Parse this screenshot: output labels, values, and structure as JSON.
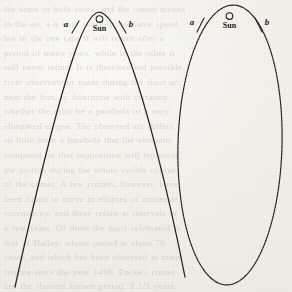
{
  "page": {
    "background_color": "#f2efe9",
    "ink_color": "#262220",
    "width": 292,
    "height": 292
  },
  "figures": [
    {
      "id": "left-figure",
      "name": "parabolic-orbit",
      "orbit_type": "parabola",
      "sun_symbol": "☉",
      "sun_label": "Sun",
      "point_a_label": "a",
      "point_b_label": "b",
      "description": "Open parabolic path with the Sun at the focus near the vertex"
    },
    {
      "id": "right-figure",
      "name": "elliptical-orbit",
      "orbit_type": "ellipse",
      "sun_symbol": "☉",
      "sun_label": "Sun",
      "point_a_label": "a",
      "point_b_label": "b",
      "description": "Closed elongated elliptical path with the Sun at the focus near the perihelion"
    }
  ],
  "labels": {
    "left_a": "a",
    "left_b": "b",
    "left_sun": "Sun",
    "left_sun_symbol": "☉",
    "right_a": "a",
    "right_b": "b",
    "right_sun": "Sun",
    "right_sun_symbol": "☉"
  },
  "showthrough_text": "the same in both cases, and the comet moves\nin the arc a b with sensibly the same speed;\nbut in the one case it will return after a\nperiod of many years, while in the other it\nwill never return. It is therefore not possible,\nfrom observations made during the short arc\nnear the Sun, to determine with certainty\nwhether the orbit be a parabola or a very\nelongated ellipse. The observed arc differs\nso little from a parabola that the elements\ncomputed on that supposition will represent\nthe motion during the whole visible course\nof the comet. A few comets, however, have\nbeen found to move in ellipses of moderate\neccentricity, and these return at intervals of\na few years. Of these the most celebrated is\nthat of Halley, whose period is about 76\nyears, and which has been observed at many\nreturns since the year 1456. Encke's comet\nhas the shortest known period, 3 1/3 years."
}
